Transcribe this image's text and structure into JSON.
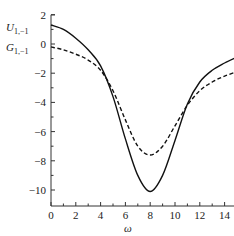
{
  "chart_data": {
    "type": "line",
    "title": "",
    "xlabel": "ω",
    "ylabel_series": [
      "U_{1,-1}",
      "G_{1,-1}"
    ],
    "xlim": [
      0,
      15
    ],
    "ylim": [
      -11,
      2
    ],
    "x_ticks": [
      0,
      2,
      4,
      6,
      8,
      10,
      12,
      14
    ],
    "y_ticks": [
      2,
      0,
      -2,
      -4,
      -6,
      -8,
      -10
    ],
    "grid": false,
    "legend": "labels at y-axis left (U above, G below)",
    "series": [
      {
        "name": "U_{1,-1}",
        "style": "solid",
        "x": [
          0,
          1,
          2,
          3,
          4,
          5,
          6,
          7,
          8,
          9,
          10,
          11,
          12,
          13,
          14,
          15
        ],
        "values": [
          1.3,
          1.0,
          0.4,
          -0.4,
          -1.5,
          -3.6,
          -6.5,
          -9.0,
          -10.1,
          -9.0,
          -6.6,
          -4.1,
          -2.6,
          -1.8,
          -1.3,
          -0.9
        ]
      },
      {
        "name": "G_{1,-1}",
        "style": "dashed",
        "x": [
          0,
          1,
          2,
          3,
          4,
          5,
          6,
          7,
          8,
          9,
          10,
          11,
          12,
          13,
          14,
          15
        ],
        "values": [
          -0.2,
          -0.4,
          -0.7,
          -1.1,
          -1.8,
          -3.2,
          -5.2,
          -7.0,
          -7.6,
          -7.0,
          -5.6,
          -4.2,
          -3.2,
          -2.6,
          -2.2,
          -1.9
        ]
      }
    ]
  },
  "labels": {
    "xlabel": "ω",
    "u_main": "U",
    "u_sub": "1,−1",
    "g_main": "G",
    "g_sub": "1,−1",
    "xticks": [
      "0",
      "2",
      "4",
      "6",
      "8",
      "10",
      "12",
      "14"
    ],
    "yticks": [
      "2",
      "0",
      "−2",
      "−4",
      "−6",
      "−8",
      "−10"
    ]
  }
}
